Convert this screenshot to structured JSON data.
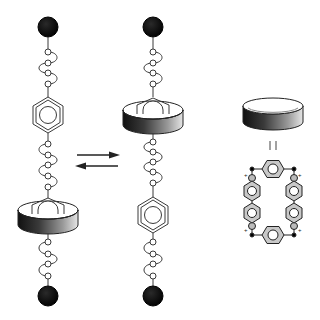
{
  "figure": {
    "equilibrium_symbol": "⇄",
    "equals_symbol": "||",
    "colors": {
      "stopper": "#0a0a0a",
      "line": "#3a3a3a",
      "ring_side_dark": "#1e1e1e",
      "ring_side_light": "#e8e8e8",
      "ring_top": "#ffffff",
      "cyclophane_fill": "#c8c8c8",
      "background": "#ffffff"
    }
  },
  "states": [
    {
      "name": "state-ring-lower",
      "components": [
        "stopper",
        "linker",
        "benzidine-station",
        "linker",
        "macrocycle-on-station",
        "linker",
        "stopper"
      ]
    },
    {
      "name": "state-ring-upper",
      "components": [
        "stopper",
        "linker",
        "macrocycle-on-station",
        "linker",
        "benzidine-station",
        "linker",
        "stopper"
      ]
    }
  ],
  "legend": {
    "macrocycle_label": "macrocycle",
    "macrocycle_structure": "cyclobis(paraquat-p-phenylene)",
    "charges": [
      "+",
      "+",
      "+",
      "+"
    ]
  }
}
